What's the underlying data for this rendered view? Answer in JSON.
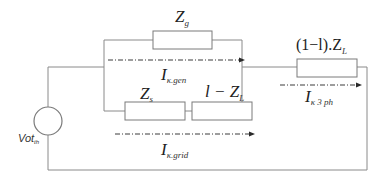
{
  "diagram": {
    "type": "equivalent-circuit",
    "source": {
      "label_main": "Vot",
      "label_sub": "th"
    },
    "components": [
      {
        "id": "zg",
        "label_main": "Z",
        "label_sub": "g"
      },
      {
        "id": "zs",
        "label_main": "Z",
        "label_sub": "s"
      },
      {
        "id": "lzl",
        "label_main": "l − Z",
        "label_sub": "L"
      },
      {
        "id": "one_minus_l_zl",
        "label_main": "(1−l).Z",
        "label_sub": "L"
      }
    ],
    "currents": [
      {
        "id": "i_gen",
        "label_main": "I",
        "label_sub": "κ.gen"
      },
      {
        "id": "i_grid",
        "label_main": "I",
        "label_sub": "κ.grid"
      },
      {
        "id": "i_3ph",
        "label_main": "I",
        "label_sub": "κ 3 ph"
      }
    ]
  }
}
